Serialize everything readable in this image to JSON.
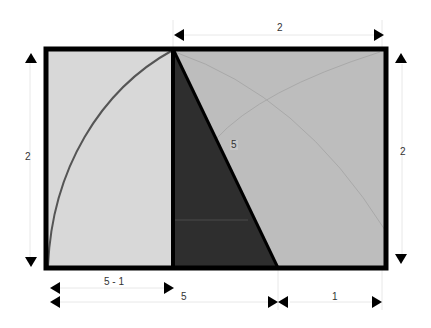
{
  "diagram": {
    "colors": {
      "background": "#ffffff",
      "border": "#000000",
      "left_panel": "#d8d8d8",
      "right_panel": "#bdbdbd",
      "triangle": "#2e2e2e",
      "arc": "#555555",
      "faint_arc": "#a8a8a8",
      "dimension_line": "#e6e6e6"
    },
    "labels": {
      "top_width": "2",
      "left_height": "2",
      "right_height": "2",
      "hypotenuse": "5",
      "bottom_left_segment": "5 - 1",
      "bottom_middle": "5",
      "bottom_right_segment": "1"
    }
  }
}
